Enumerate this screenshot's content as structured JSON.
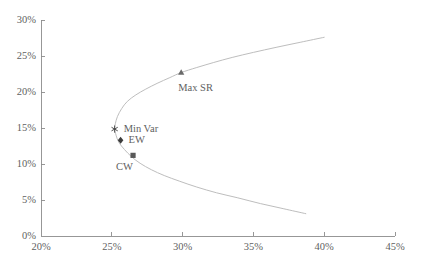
{
  "chart_data": {
    "type": "line",
    "title": "",
    "subtitle": "",
    "xlabel": "",
    "ylabel": "",
    "xlim": [
      20,
      45
    ],
    "ylim": [
      0,
      30
    ],
    "xticks": [
      "20%",
      "25%",
      "30%",
      "35%",
      "40%",
      "45%"
    ],
    "xtick_values": [
      20,
      25,
      30,
      35,
      40,
      45
    ],
    "yticks": [
      "0%",
      "5%",
      "10%",
      "15%",
      "20%",
      "25%",
      "30%"
    ],
    "ytick_values": [
      0,
      5,
      10,
      15,
      20,
      25,
      30
    ],
    "grid": false,
    "legend": "none",
    "axis_units": "percent",
    "series": [
      {
        "name": "Efficient frontier (upper branch)",
        "color": "#b9b9b9",
        "x": [
          25.2,
          25.25,
          25.4,
          25.7,
          26.1,
          26.7,
          27.4,
          28.2,
          29.1,
          29.9,
          31.0,
          32.2,
          33.5,
          35.0,
          36.6,
          38.3,
          40.0
        ],
        "y": [
          14.9,
          15.6,
          16.6,
          17.7,
          18.7,
          19.6,
          20.4,
          21.2,
          22.0,
          22.7,
          23.4,
          24.1,
          24.8,
          25.5,
          26.2,
          26.9,
          27.6
        ]
      },
      {
        "name": "Frontier (lower branch)",
        "color": "#b9b9b9",
        "x": [
          25.2,
          25.3,
          25.5,
          25.9,
          26.4,
          27.0,
          27.8,
          28.7,
          29.8,
          31.0,
          32.4,
          33.9,
          35.5,
          37.1,
          38.7
        ],
        "y": [
          14.9,
          14.0,
          13.0,
          12.0,
          11.0,
          10.1,
          9.2,
          8.4,
          7.6,
          6.8,
          6.0,
          5.3,
          4.5,
          3.8,
          3.1
        ]
      }
    ],
    "points": [
      {
        "id": "min-var",
        "label": "Min Var",
        "marker": "asterisk",
        "color": "#444444",
        "x": 25.2,
        "y": 14.85,
        "label_dx": 9,
        "label_dy": 0
      },
      {
        "id": "ew",
        "label": "EW",
        "marker": "diamond",
        "color": "#3c3c3c",
        "x": 25.62,
        "y": 13.3,
        "label_dx": 8,
        "label_dy": 0
      },
      {
        "id": "cw",
        "label": "CW",
        "marker": "square",
        "color": "#595959",
        "x": 26.5,
        "y": 11.2,
        "label_dx": -17,
        "label_dy": 12
      },
      {
        "id": "max-sr",
        "label": "Max SR",
        "marker": "triangle",
        "color": "#6a6a6a",
        "x": 29.9,
        "y": 22.7,
        "label_dx": -3,
        "label_dy": 15
      }
    ],
    "colors": {
      "axis": "#8c8c8c",
      "curve": "#b9b9b9",
      "text": "#5f5f5f",
      "background": "#ffffff"
    }
  },
  "figure": {
    "bottom_artifact_text": ""
  }
}
